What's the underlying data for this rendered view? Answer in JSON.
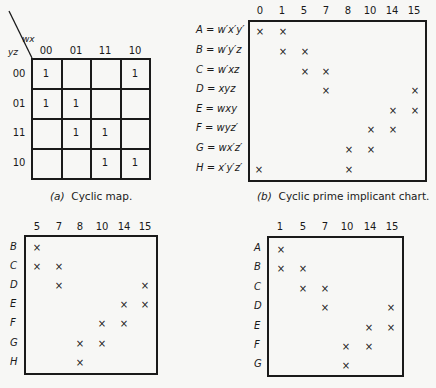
{
  "map": {
    "var_top": "wx",
    "var_left": "yz",
    "col_labels": [
      "00",
      "01",
      "11",
      "10"
    ],
    "row_labels": [
      "00",
      "01",
      "11",
      "10"
    ],
    "cells": [
      [
        "1",
        "",
        "",
        "1"
      ],
      [
        "1",
        "1",
        "",
        ""
      ],
      [
        "",
        "1",
        "1",
        ""
      ],
      [
        "",
        "",
        "1",
        "1"
      ]
    ],
    "caption_prefix": "(a)",
    "caption": "Cyclic map."
  },
  "chart_b": {
    "columns": [
      "0",
      "1",
      "5",
      "7",
      "8",
      "10",
      "14",
      "15"
    ],
    "rows": [
      {
        "label": "A = w′x′y′",
        "marks": [
          "0",
          "1"
        ]
      },
      {
        "label": "B = w′y′z",
        "marks": [
          "1",
          "5"
        ]
      },
      {
        "label": "C = w′xz",
        "marks": [
          "5",
          "7"
        ]
      },
      {
        "label": "D = xyz",
        "marks": [
          "7",
          "15"
        ]
      },
      {
        "label": "E = wxy",
        "marks": [
          "14",
          "15"
        ]
      },
      {
        "label": "F = wyz′",
        "marks": [
          "10",
          "14"
        ]
      },
      {
        "label": "G = wx′z′",
        "marks": [
          "8",
          "10"
        ]
      },
      {
        "label": "H = x′y′z′",
        "marks": [
          "0",
          "8"
        ]
      }
    ],
    "mark_symbol": "×",
    "caption_prefix": "(b)",
    "caption": "Cyclic prime implicant chart."
  },
  "chart_c": {
    "columns": [
      "5",
      "7",
      "8",
      "10",
      "14",
      "15"
    ],
    "rows": [
      {
        "label": "B",
        "marks": [
          "5"
        ]
      },
      {
        "label": "C",
        "marks": [
          "5",
          "7"
        ]
      },
      {
        "label": "D",
        "marks": [
          "7",
          "15"
        ]
      },
      {
        "label": "E",
        "marks": [
          "14",
          "15"
        ]
      },
      {
        "label": "F",
        "marks": [
          "10",
          "14"
        ]
      },
      {
        "label": "G",
        "marks": [
          "8",
          "10"
        ]
      },
      {
        "label": "H",
        "marks": [
          "8"
        ]
      }
    ],
    "mark_symbol": "×"
  },
  "chart_d": {
    "columns": [
      "1",
      "5",
      "7",
      "10",
      "14",
      "15"
    ],
    "rows": [
      {
        "label": "A",
        "marks": [
          "1"
        ]
      },
      {
        "label": "B",
        "marks": [
          "1",
          "5"
        ]
      },
      {
        "label": "C",
        "marks": [
          "5",
          "7"
        ]
      },
      {
        "label": "D",
        "marks": [
          "7",
          "15"
        ]
      },
      {
        "label": "E",
        "marks": [
          "14",
          "15"
        ]
      },
      {
        "label": "F",
        "marks": [
          "10",
          "14"
        ]
      },
      {
        "label": "G",
        "marks": [
          "10"
        ]
      }
    ],
    "mark_symbol": "×"
  }
}
